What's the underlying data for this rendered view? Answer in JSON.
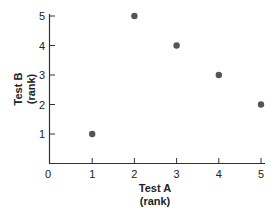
{
  "chart_data": {
    "type": "scatter",
    "title": "",
    "xlabel": "Test A\n(rank)",
    "ylabel": "Test B\n(rank)",
    "xlabel_lines": [
      "Test A",
      "(rank)"
    ],
    "ylabel_lines": [
      "Test B",
      "(rank)"
    ],
    "x_ticks": [
      "0",
      "1",
      "2",
      "3",
      "4",
      "5"
    ],
    "y_ticks": [
      "1",
      "2",
      "3",
      "4",
      "5"
    ],
    "xlim": [
      0,
      5
    ],
    "ylim": [
      0,
      5
    ],
    "grid": false,
    "legend": null,
    "series": [
      {
        "name": "ranks",
        "color": "#555555",
        "points": [
          {
            "x": 1,
            "y": 1
          },
          {
            "x": 2,
            "y": 5
          },
          {
            "x": 3,
            "y": 4
          },
          {
            "x": 4,
            "y": 3
          },
          {
            "x": 5,
            "y": 2
          }
        ]
      }
    ]
  }
}
